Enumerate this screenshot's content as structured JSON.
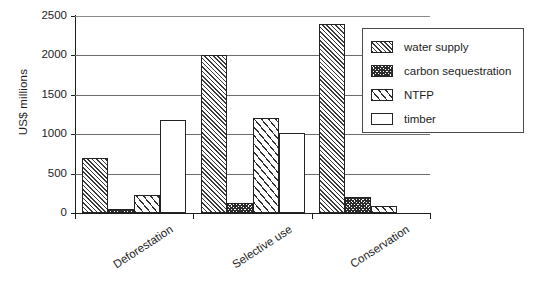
{
  "chart_data": {
    "type": "bar",
    "title": "",
    "subtitle": "",
    "xlabel": "",
    "ylabel": "US$ millions",
    "ylim": [
      0,
      2500
    ],
    "ytick_labels": [
      "2500",
      "2000",
      "1500",
      "1000",
      "500",
      "0"
    ],
    "ytick_values": [
      2500,
      2000,
      1500,
      1000,
      500,
      0
    ],
    "grid": true,
    "legend_position": "top-right",
    "categories": [
      "Deforestation",
      "Selective use",
      "Conservation"
    ],
    "series": [
      {
        "name": "water supply",
        "pattern": "dense-diagonal-hatch",
        "values": [
          700,
          2000,
          2400
        ]
      },
      {
        "name": "carbon sequestration",
        "pattern": "dark-cross-hatch",
        "values": [
          50,
          130,
          200
        ]
      },
      {
        "name": "NTFP",
        "pattern": "wide-diagonal-hatch",
        "values": [
          230,
          1210,
          90
        ]
      },
      {
        "name": "timber",
        "pattern": "solid-white",
        "values": [
          1180,
          1010,
          0
        ]
      }
    ]
  },
  "colors": {
    "axis": "#1d1d1d",
    "gridline": "#6d6d6d",
    "hatch": "#2f2f2f",
    "plot_background": "#ffffff",
    "legend_border": "#4a4a4a"
  }
}
